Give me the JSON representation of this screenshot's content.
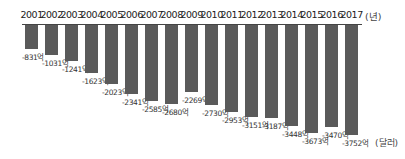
{
  "chart_data": {
    "type": "bar",
    "title": "",
    "xlabel": "(년)",
    "ylabel": "(달러)",
    "orientation": "downward from top axis",
    "categories": [
      "2001",
      "2002",
      "2003",
      "2004",
      "2005",
      "2006",
      "2007",
      "2008",
      "2009",
      "2010",
      "2011",
      "2012",
      "2013",
      "2014",
      "2015",
      "2016",
      "2017"
    ],
    "values": [
      -831,
      -1031,
      -1241,
      -1623,
      -2023,
      -2341,
      -2585,
      -2680,
      -2269,
      -2730,
      -2953,
      -3151,
      -3187,
      -3448,
      -3673,
      -3470,
      -3752
    ],
    "value_labels": [
      "-831억",
      "-1031억",
      "-1241억",
      "-1623억",
      "-2023억",
      "-2341억",
      "-2585억",
      "-2680억",
      "-2269억",
      "-2730억",
      "-2953억",
      "-3151억",
      "-3187억",
      "-3448억",
      "-3673억",
      "-3470억",
      "-3752억"
    ],
    "ylim": [
      -3800,
      0
    ],
    "grid": false,
    "legend": null,
    "bar_color": "#5a5a5a"
  },
  "labels": {
    "x_unit": "(년)",
    "y_unit": "(달러)"
  }
}
